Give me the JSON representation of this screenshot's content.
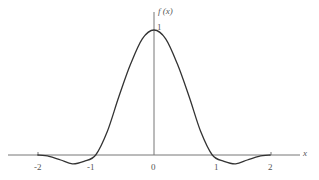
{
  "chart_data": {
    "type": "line",
    "title": "",
    "xlabel": "x",
    "ylabel": "f(x)",
    "xlim": [
      -2,
      2
    ],
    "ylim": [
      -0.1,
      1.1
    ],
    "x_ticks": [
      "-2",
      "-1",
      "0",
      "1",
      "2"
    ],
    "y_ticks": [
      "1"
    ],
    "grid": false,
    "series": [
      {
        "name": "f(x)",
        "x": [
          -2.0,
          -1.8,
          -1.6,
          -1.4,
          -1.2,
          -1.0,
          -0.8,
          -0.6,
          -0.4,
          -0.2,
          0.0,
          0.2,
          0.4,
          0.6,
          0.8,
          1.0,
          1.2,
          1.4,
          1.6,
          1.8,
          2.0
        ],
        "values": [
          0.0,
          -0.01,
          -0.04,
          -0.07,
          -0.05,
          0.0,
          0.19,
          0.47,
          0.73,
          0.93,
          1.0,
          0.93,
          0.73,
          0.47,
          0.19,
          0.0,
          -0.05,
          -0.07,
          -0.04,
          -0.01,
          0.0
        ]
      }
    ]
  },
  "labels": {
    "y_axis": "f (x)",
    "x_axis": "x",
    "tick_neg2": "-2",
    "tick_neg1": "-1",
    "tick_0": "0",
    "tick_1": "1",
    "tick_2": "2",
    "y_tick_1": "1"
  }
}
